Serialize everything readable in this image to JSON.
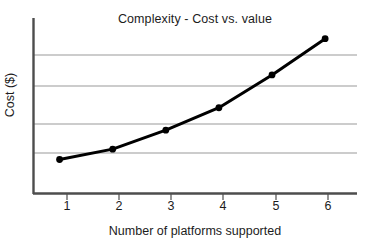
{
  "chart_data": {
    "type": "line",
    "title": "Complexity - Cost vs. value",
    "xlabel": "Number of platforms supported",
    "ylabel": "Cost ($)",
    "x": [
      1,
      2,
      3,
      4,
      5,
      6
    ],
    "xticklabels": [
      "1",
      "2",
      "3",
      "4",
      "5",
      "6"
    ],
    "yticklabels": [],
    "values": [
      1,
      1.3,
      1.85,
      2.5,
      3.45,
      4.5
    ],
    "series": [
      {
        "name": "Cost",
        "values": [
          1,
          1.3,
          1.85,
          2.5,
          3.45,
          4.5
        ]
      }
    ],
    "xlim": [
      0.5,
      6.6
    ],
    "ylim": [
      0,
      5.1
    ],
    "grid": "horizontal",
    "gridline_values": [
      1,
      2,
      3,
      4
    ],
    "legend": "none",
    "marker": "filled-circle",
    "line_color": "#000000",
    "grid_color": "#9a9a9a",
    "axis_color": "#4d4d4d",
    "background_color": "#ffffff"
  },
  "ticks": {
    "x": [
      "1",
      "2",
      "3",
      "4",
      "5",
      "6"
    ]
  }
}
